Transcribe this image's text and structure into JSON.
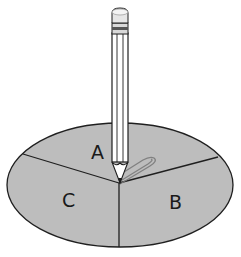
{
  "figure": {
    "sections": [
      {
        "id": "A",
        "label": "A"
      },
      {
        "id": "B",
        "label": "B"
      },
      {
        "id": "C",
        "label": "C"
      }
    ],
    "colors": {
      "spinner_fill": "#bdbdbd",
      "outline": "#1f1f1f",
      "background": "#ffffff"
    }
  }
}
